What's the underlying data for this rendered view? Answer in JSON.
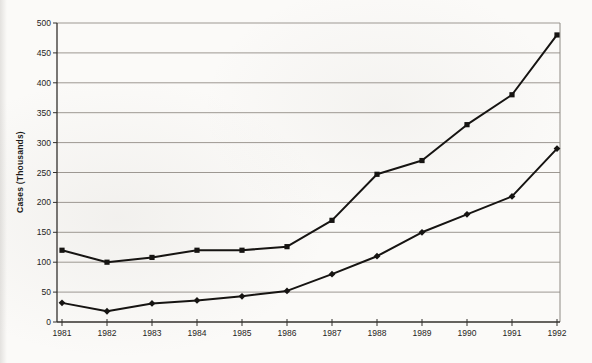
{
  "page": {
    "background": "#fbfaf8",
    "kind": "scanned line chart, no title, no legend"
  },
  "chart_data": {
    "type": "line",
    "title": "",
    "xlabel": "",
    "ylabel": "Cases (Thousands)",
    "categories": [
      "1981",
      "1982",
      "1983",
      "1984",
      "1985",
      "1986",
      "1987",
      "1988",
      "1989",
      "1990",
      "1991",
      "1992"
    ],
    "series": [
      {
        "name": "upper-series",
        "marker": "square",
        "color": "#161412",
        "values": [
          120,
          100,
          108,
          120,
          120,
          126,
          170,
          247,
          270,
          330,
          380,
          480
        ]
      },
      {
        "name": "lower-series",
        "marker": "diamond",
        "color": "#161412",
        "values": [
          32,
          18,
          31,
          36,
          43,
          52,
          80,
          110,
          150,
          180,
          210,
          290
        ]
      }
    ],
    "ylim": [
      0,
      500
    ],
    "ytick_step": 50,
    "ytick_labels": [
      "0",
      "50",
      "100",
      "150",
      "200",
      "250",
      "300",
      "350",
      "400",
      "450",
      "500"
    ],
    "grid": "horizontal",
    "legend": "none",
    "gridline_color": "#9d9892",
    "border_color": "#8e8a84",
    "axis_color": "#33302d",
    "line_color": "#161412"
  }
}
